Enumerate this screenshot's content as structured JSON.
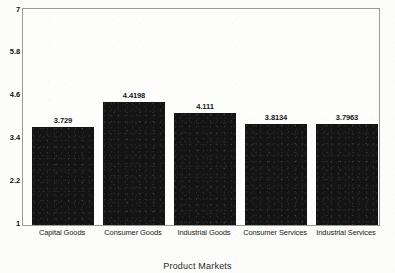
{
  "chart_data": {
    "type": "bar",
    "title": "",
    "xlabel": "Product Markets",
    "ylabel": "",
    "categories": [
      "Capital Goods",
      "Consumer Goods",
      "Industrial Goods",
      "Consumer Services",
      "Industrial Services"
    ],
    "values": [
      3.729,
      4.4198,
      4.111,
      3.8134,
      3.7963
    ],
    "value_labels": [
      "3.729",
      "4.4198",
      "4.111",
      "3.8134",
      "3.7963"
    ],
    "ylim": [
      1,
      7
    ],
    "yticks": [
      1,
      2.2,
      3.4,
      4.6,
      5.8,
      7
    ],
    "ytick_labels": [
      "1",
      "2.2",
      "3.4",
      "4.6",
      "5.8",
      "7"
    ],
    "grid": false,
    "legend": null,
    "bar_color": "#141414",
    "frame_color": "#9a9a96",
    "background_color": "#fcfcfa"
  }
}
